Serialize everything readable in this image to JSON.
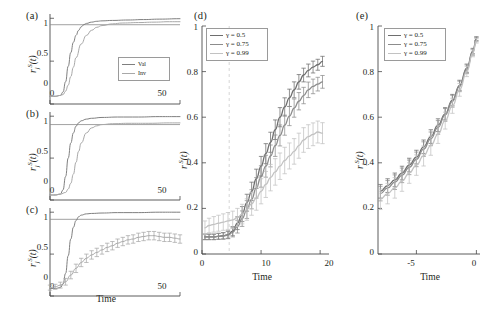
{
  "figure": {
    "background": "#ffffff",
    "panels": [
      "a",
      "b",
      "c",
      "d",
      "e"
    ]
  },
  "labels": {
    "panel_a": "(a)",
    "panel_b": "(b)",
    "panel_c": "(c)",
    "panel_d": "(d)",
    "panel_e": "(e)",
    "xlabel_time": "Time",
    "ylabel_r": "r",
    "ylabel_sub": "j",
    "ylabel_sup": "S",
    "ylabel_arg": "(t)"
  },
  "legend_small": {
    "entries": [
      {
        "label": "Val",
        "color": "#7f7f7f"
      },
      {
        "label": "Inv",
        "color": "#a8a8a8"
      }
    ]
  },
  "legend_gamma": {
    "entries": [
      {
        "label": "γ = 0.5",
        "color": "#6e6e6e"
      },
      {
        "label": "γ = 0.75",
        "color": "#8c8c8c"
      },
      {
        "label": "γ = 0.99",
        "color": "#c2c2c2"
      }
    ]
  },
  "colors": {
    "axis": "#4a4a4a",
    "gamma_050": "#6e6e6e",
    "gamma_075": "#8c8c8c",
    "gamma_099": "#c2c2c2",
    "val": "#7f7f7f",
    "inv": "#a8a8a8",
    "guide_dashed": "#d6d6d6",
    "text": "#231f20"
  },
  "chart_data": [
    {
      "id": "panel-a",
      "type": "line",
      "title": "(a)",
      "xlabel": "Time",
      "ylabel": "r_j^S(t)",
      "xlim": [
        0,
        50
      ],
      "ylim": [
        0,
        1.05
      ],
      "xticks": [
        0,
        50
      ],
      "xticklabels": [
        "0",
        "50"
      ],
      "yticks": [
        0,
        0.5,
        1
      ],
      "yticklabels": [
        "0",
        "0.5",
        "1"
      ],
      "grid": false,
      "legend_position": "lower-right",
      "hline": 0.925,
      "series": [
        {
          "name": "Val",
          "color": "#7f7f7f",
          "x": [
            0,
            2,
            4,
            5,
            6,
            7,
            8,
            9,
            10,
            11,
            12,
            13,
            14,
            16,
            18,
            20,
            24,
            30,
            36,
            42,
            50
          ],
          "values": [
            0.09,
            0.09,
            0.1,
            0.14,
            0.26,
            0.44,
            0.6,
            0.72,
            0.8,
            0.86,
            0.9,
            0.925,
            0.94,
            0.955,
            0.965,
            0.97,
            0.975,
            0.98,
            0.985,
            0.99,
            0.995
          ]
        },
        {
          "name": "Inv",
          "color": "#a8a8a8",
          "x": [
            0,
            2,
            4,
            5,
            6,
            7,
            8,
            9,
            10,
            12,
            14,
            16,
            18,
            20,
            24,
            28,
            34,
            40,
            46,
            50
          ],
          "values": [
            0.09,
            0.09,
            0.1,
            0.11,
            0.15,
            0.22,
            0.32,
            0.43,
            0.54,
            0.7,
            0.8,
            0.86,
            0.895,
            0.915,
            0.935,
            0.945,
            0.95,
            0.955,
            0.96,
            0.96
          ]
        }
      ]
    },
    {
      "id": "panel-b",
      "type": "line",
      "title": "(b)",
      "xlabel": "Time",
      "ylabel": "r_j^S(t)",
      "xlim": [
        0,
        50
      ],
      "ylim": [
        0,
        1.05
      ],
      "xticks": [
        0,
        50
      ],
      "xticklabels": [
        "0",
        "50"
      ],
      "yticks": [
        0,
        0.5,
        1
      ],
      "yticklabels": [
        "0",
        "0.5",
        "1"
      ],
      "grid": false,
      "hline": 0.9,
      "series": [
        {
          "name": "Val",
          "color": "#7f7f7f",
          "x": [
            0,
            2,
            4,
            5,
            6,
            7,
            8,
            9,
            10,
            11,
            12,
            14,
            16,
            20,
            26,
            34,
            42,
            50
          ],
          "values": [
            0.06,
            0.06,
            0.07,
            0.12,
            0.28,
            0.5,
            0.68,
            0.8,
            0.88,
            0.92,
            0.945,
            0.965,
            0.975,
            0.985,
            0.99,
            0.99,
            0.995,
            0.995
          ]
        },
        {
          "name": "Inv",
          "color": "#a8a8a8",
          "x": [
            0,
            2,
            4,
            6,
            7,
            8,
            9,
            10,
            11,
            12,
            14,
            16,
            18,
            20,
            24,
            30,
            38,
            46,
            50
          ],
          "values": [
            0.06,
            0.06,
            0.07,
            0.09,
            0.13,
            0.2,
            0.31,
            0.45,
            0.58,
            0.68,
            0.8,
            0.86,
            0.885,
            0.9,
            0.91,
            0.915,
            0.915,
            0.92,
            0.92
          ]
        }
      ]
    },
    {
      "id": "panel-c",
      "type": "line",
      "title": "(c)",
      "xlabel": "Time",
      "ylabel": "r_j^S(t)",
      "xlim": [
        0,
        50
      ],
      "ylim": [
        0,
        1.05
      ],
      "xticks": [
        0,
        50
      ],
      "xticklabels": [
        "0",
        "50"
      ],
      "yticks": [
        0,
        0.5,
        1
      ],
      "yticklabels": [
        "0",
        "0.5",
        "1"
      ],
      "grid": false,
      "hline": 0.915,
      "has_errorbars": true,
      "series": [
        {
          "name": "Val",
          "color": "#7f7f7f",
          "x": [
            0,
            2,
            4,
            5,
            6,
            7,
            8,
            9,
            10,
            11,
            12,
            14,
            16,
            20,
            26,
            34,
            42,
            50
          ],
          "values": [
            0.09,
            0.09,
            0.1,
            0.14,
            0.27,
            0.48,
            0.68,
            0.82,
            0.9,
            0.945,
            0.965,
            0.98,
            0.985,
            0.99,
            0.995,
            0.995,
            1.0,
            1.0
          ]
        },
        {
          "name": "Inv",
          "color": "#a8a8a8",
          "x": [
            0,
            2,
            4,
            6,
            8,
            10,
            12,
            14,
            16,
            18,
            20,
            22,
            24,
            26,
            28,
            30,
            32,
            34,
            36,
            38,
            40,
            42,
            44,
            46,
            48,
            50
          ],
          "values": [
            0.1,
            0.11,
            0.13,
            0.17,
            0.25,
            0.33,
            0.4,
            0.45,
            0.49,
            0.52,
            0.55,
            0.58,
            0.6,
            0.63,
            0.65,
            0.67,
            0.68,
            0.7,
            0.71,
            0.72,
            0.72,
            0.71,
            0.7,
            0.7,
            0.69,
            0.68
          ],
          "errors": [
            0.03,
            0.03,
            0.035,
            0.04,
            0.045,
            0.05,
            0.05,
            0.05,
            0.05,
            0.05,
            0.05,
            0.05,
            0.05,
            0.05,
            0.05,
            0.05,
            0.05,
            0.05,
            0.05,
            0.05,
            0.05,
            0.05,
            0.05,
            0.05,
            0.05,
            0.05
          ]
        }
      ]
    },
    {
      "id": "panel-d",
      "type": "line",
      "title": "(d)",
      "xlabel": "Time",
      "ylabel": "r_j^S(t)",
      "xlim": [
        0,
        21.5
      ],
      "ylim": [
        0,
        1.0
      ],
      "xticks": [
        0,
        10,
        20
      ],
      "xticklabels": [
        "0",
        "10",
        "20"
      ],
      "yticks": [
        0,
        0.2,
        0.4,
        0.6,
        0.8,
        1
      ],
      "yticklabels": [
        "0",
        "0.2",
        "0.4",
        "0.6",
        "0.8",
        "1"
      ],
      "grid": false,
      "legend_position": "upper-left",
      "vline_dashed": 4.6,
      "has_errorbars": true,
      "series": [
        {
          "name": "γ = 0.5",
          "color": "#6e6e6e",
          "x": [
            0.5,
            1.2,
            2,
            2.8,
            3.6,
            4.4,
            5.2,
            6,
            6.8,
            7.6,
            8.4,
            9.2,
            10,
            10.8,
            11.6,
            12.4,
            13.2,
            14,
            14.8,
            15.6,
            16.4,
            17.2,
            18,
            18.8,
            19.6,
            20.4
          ],
          "values": [
            0.075,
            0.075,
            0.075,
            0.078,
            0.08,
            0.085,
            0.1,
            0.135,
            0.175,
            0.225,
            0.275,
            0.33,
            0.385,
            0.44,
            0.49,
            0.545,
            0.6,
            0.645,
            0.685,
            0.72,
            0.755,
            0.785,
            0.805,
            0.82,
            0.83,
            0.845
          ],
          "errors": [
            0.012,
            0.012,
            0.012,
            0.013,
            0.014,
            0.016,
            0.02,
            0.028,
            0.033,
            0.037,
            0.04,
            0.042,
            0.043,
            0.044,
            0.044,
            0.043,
            0.042,
            0.04,
            0.038,
            0.035,
            0.032,
            0.03,
            0.028,
            0.026,
            0.024,
            0.022
          ]
        },
        {
          "name": "γ = 0.75",
          "color": "#8c8c8c",
          "x": [
            0.5,
            1.2,
            2,
            2.8,
            3.6,
            4.4,
            5.2,
            6,
            6.8,
            7.6,
            8.4,
            9.2,
            10,
            10.8,
            11.6,
            12.4,
            13.2,
            14,
            14.8,
            15.6,
            16.4,
            17.2,
            18,
            18.8,
            19.6,
            20.4
          ],
          "values": [
            0.075,
            0.075,
            0.075,
            0.077,
            0.079,
            0.083,
            0.095,
            0.12,
            0.155,
            0.195,
            0.24,
            0.29,
            0.34,
            0.385,
            0.43,
            0.475,
            0.52,
            0.565,
            0.605,
            0.64,
            0.67,
            0.695,
            0.72,
            0.735,
            0.745,
            0.755
          ],
          "errors": [
            0.012,
            0.012,
            0.012,
            0.013,
            0.014,
            0.016,
            0.02,
            0.028,
            0.034,
            0.039,
            0.042,
            0.045,
            0.047,
            0.048,
            0.048,
            0.047,
            0.046,
            0.044,
            0.042,
            0.04,
            0.038,
            0.036,
            0.034,
            0.032,
            0.03,
            0.028
          ]
        },
        {
          "name": "γ = 0.99",
          "color": "#c2c2c2",
          "x": [
            0.5,
            1.2,
            2,
            2.8,
            3.6,
            4.4,
            5.2,
            6,
            6.8,
            7.6,
            8.4,
            9.2,
            10,
            10.8,
            11.6,
            12.4,
            13.2,
            14,
            14.8,
            15.6,
            16.4,
            17.2,
            18,
            18.8,
            19.6,
            20.4
          ],
          "values": [
            0.115,
            0.125,
            0.13,
            0.135,
            0.14,
            0.145,
            0.15,
            0.16,
            0.175,
            0.195,
            0.22,
            0.245,
            0.275,
            0.305,
            0.335,
            0.36,
            0.385,
            0.41,
            0.43,
            0.45,
            0.475,
            0.5,
            0.515,
            0.525,
            0.535,
            0.53
          ],
          "errors": [
            0.03,
            0.032,
            0.034,
            0.035,
            0.036,
            0.037,
            0.038,
            0.04,
            0.043,
            0.047,
            0.05,
            0.053,
            0.055,
            0.057,
            0.058,
            0.058,
            0.058,
            0.058,
            0.057,
            0.056,
            0.055,
            0.054,
            0.052,
            0.05,
            0.048,
            0.046
          ]
        }
      ]
    },
    {
      "id": "panel-e",
      "type": "line",
      "title": "(e)",
      "xlabel": "Time",
      "ylabel": "r_j^S(t)",
      "xlim": [
        -8.2,
        0.3
      ],
      "ylim": [
        0,
        1.0
      ],
      "xticks": [
        -5,
        0
      ],
      "xticklabels": [
        "-5",
        "0"
      ],
      "yticks": [
        0,
        0.2,
        0.4,
        0.6,
        0.8,
        1
      ],
      "yticklabels": [
        "0",
        "0.2",
        "0.4",
        "0.6",
        "0.8",
        "1"
      ],
      "grid": false,
      "legend_position": "upper-left",
      "has_errorbars": true,
      "series": [
        {
          "name": "γ = 0.5",
          "color": "#6e6e6e",
          "x": [
            -8,
            -7.4,
            -6.8,
            -6.2,
            -5.6,
            -5,
            -4.4,
            -3.8,
            -3.2,
            -2.6,
            -2,
            -1.4,
            -0.8,
            -0.3,
            0
          ],
          "values": [
            0.275,
            0.3,
            0.325,
            0.355,
            0.39,
            0.425,
            0.47,
            0.515,
            0.565,
            0.615,
            0.675,
            0.74,
            0.815,
            0.89,
            0.945
          ],
          "errors": [
            0.03,
            0.03,
            0.03,
            0.03,
            0.03,
            0.03,
            0.03,
            0.03,
            0.028,
            0.027,
            0.025,
            0.022,
            0.018,
            0.012,
            0.008
          ]
        },
        {
          "name": "γ = 0.75",
          "color": "#8c8c8c",
          "x": [
            -8,
            -7.4,
            -6.8,
            -6.2,
            -5.6,
            -5,
            -4.4,
            -3.8,
            -3.2,
            -2.6,
            -2,
            -1.4,
            -0.8,
            -0.3,
            0
          ],
          "values": [
            0.265,
            0.29,
            0.315,
            0.345,
            0.38,
            0.415,
            0.46,
            0.505,
            0.555,
            0.61,
            0.67,
            0.735,
            0.81,
            0.885,
            0.94
          ],
          "errors": [
            0.032,
            0.032,
            0.032,
            0.032,
            0.032,
            0.032,
            0.032,
            0.03,
            0.03,
            0.028,
            0.026,
            0.023,
            0.019,
            0.013,
            0.009
          ]
        },
        {
          "name": "γ = 0.99",
          "color": "#c2c2c2",
          "x": [
            -8,
            -7.4,
            -6.8,
            -6.2,
            -5.6,
            -5,
            -4.4,
            -3.8,
            -3.2,
            -2.6,
            -2,
            -1.4,
            -0.8,
            -0.3,
            0
          ],
          "values": [
            0.24,
            0.265,
            0.29,
            0.32,
            0.355,
            0.39,
            0.43,
            0.475,
            0.525,
            0.585,
            0.65,
            0.72,
            0.8,
            0.88,
            0.935
          ],
          "errors": [
            0.045,
            0.045,
            0.045,
            0.045,
            0.045,
            0.045,
            0.044,
            0.042,
            0.04,
            0.037,
            0.033,
            0.028,
            0.022,
            0.015,
            0.01
          ]
        }
      ]
    }
  ]
}
